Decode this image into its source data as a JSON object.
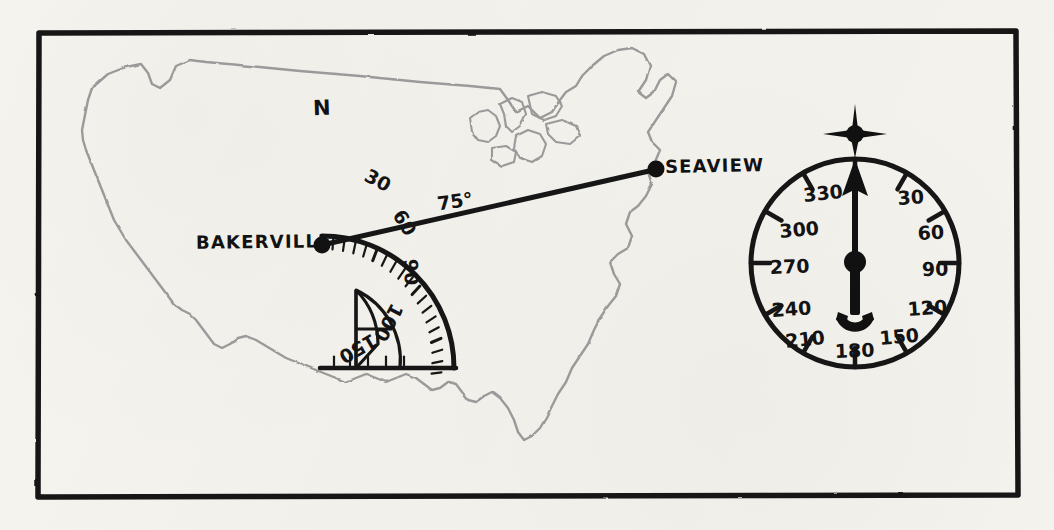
{
  "figure": {
    "medium": "hand-drawn pencil and ink sketch on paper",
    "background_color": "#f4f2ed",
    "ink_color": "#121212",
    "pencil_color": "#8c8c8c",
    "frame": {
      "name": "border-rectangle",
      "x": 37,
      "y": 31,
      "width": 981,
      "height": 466
    }
  },
  "map": {
    "region_label": "contiguous united states outline",
    "cities": [
      {
        "name": "BAKERVILLE",
        "label": "BAKERVILLE",
        "marker_x": 322,
        "marker_y": 245,
        "label_align": "right-of-left"
      },
      {
        "name": "SEAVIEW",
        "label": "SEAVIEW",
        "marker_x": 655,
        "marker_y": 169,
        "label_align": "left-of-right"
      }
    ],
    "bearing_line": {
      "from": "BAKERVILLE",
      "to": "SEAVIEW",
      "angle_label": "75°",
      "angle_value": 75,
      "units": "degrees"
    },
    "north_line": {
      "label": "N",
      "top_x": 322,
      "top_y": 118,
      "bottom_x": 322,
      "bottom_y": 368
    }
  },
  "protractor": {
    "name": "half-circle-protractor",
    "center_x": 322,
    "center_y": 368,
    "outer_radius": 132,
    "inner_radius": 78,
    "baseline_y": 368,
    "tick_interval_degrees": 5,
    "labeled_ticks": [
      {
        "value": "30",
        "degrees": 30
      },
      {
        "value": "60",
        "degrees": 60
      },
      {
        "value": "90",
        "degrees": 90
      },
      {
        "value": "100",
        "degrees": 110
      },
      {
        "value": "150",
        "degrees": 145
      }
    ]
  },
  "compass": {
    "name": "compass-rose-dial",
    "center_x": 855,
    "center_y": 263,
    "radius": 104,
    "north_star_label": "north-star-marker",
    "needle_heading_degrees": 0,
    "needle_heading_label": "0",
    "tick_interval_degrees": 30,
    "degree_labels": [
      {
        "value": "30",
        "degrees": 30
      },
      {
        "value": "60",
        "degrees": 60
      },
      {
        "value": "90",
        "degrees": 90
      },
      {
        "value": "120",
        "degrees": 120
      },
      {
        "value": "150",
        "degrees": 150
      },
      {
        "value": "180",
        "degrees": 180
      },
      {
        "value": "210",
        "degrees": 210
      },
      {
        "value": "240",
        "degrees": 240
      },
      {
        "value": "270",
        "degrees": 270
      },
      {
        "value": "300",
        "degrees": 300
      },
      {
        "value": "330",
        "degrees": 330
      }
    ]
  }
}
